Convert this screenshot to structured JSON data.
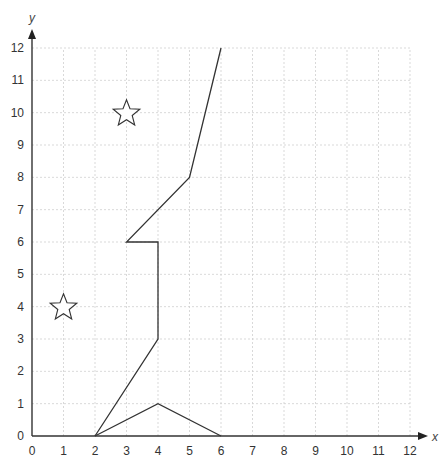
{
  "chart_data": {
    "type": "diagram",
    "title": "",
    "xlabel": "x",
    "ylabel": "y",
    "xlim": [
      0,
      12
    ],
    "ylim": [
      0,
      12
    ],
    "grid": true,
    "x_ticks": [
      "0",
      "1",
      "2",
      "3",
      "4",
      "5",
      "6",
      "7",
      "8",
      "9",
      "10",
      "11",
      "12"
    ],
    "y_ticks": [
      "0",
      "1",
      "2",
      "3",
      "4",
      "5",
      "6",
      "7",
      "8",
      "9",
      "10",
      "11",
      "12"
    ],
    "polylines": [
      {
        "name": "path-main",
        "points": [
          [
            2,
            0
          ],
          [
            4,
            3
          ],
          [
            4,
            6
          ],
          [
            3,
            6
          ],
          [
            5,
            8
          ],
          [
            6,
            12
          ]
        ]
      },
      {
        "name": "triangle-base",
        "points": [
          [
            2,
            0
          ],
          [
            4,
            1
          ],
          [
            6,
            0
          ]
        ]
      }
    ],
    "stars": [
      {
        "name": "star-1",
        "x": 3,
        "y": 10
      },
      {
        "name": "star-2",
        "x": 1,
        "y": 4
      }
    ]
  }
}
